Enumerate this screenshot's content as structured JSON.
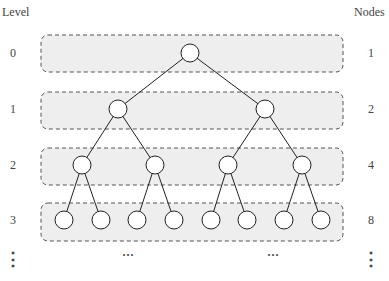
{
  "headers": {
    "left": "Level",
    "right": "Nodes"
  },
  "rows": [
    {
      "level": "0",
      "nodes": "1"
    },
    {
      "level": "1",
      "nodes": "2"
    },
    {
      "level": "2",
      "nodes": "4"
    },
    {
      "level": "3",
      "nodes": "8"
    }
  ],
  "continuation": {
    "level": "⋮",
    "nodes": "⋮",
    "middle_left": "···",
    "middle_right": "···"
  },
  "colors": {
    "band_fill": "#eeeeee",
    "band_stroke": "#555555",
    "edge": "#222222",
    "node_fill": "#ffffff"
  }
}
